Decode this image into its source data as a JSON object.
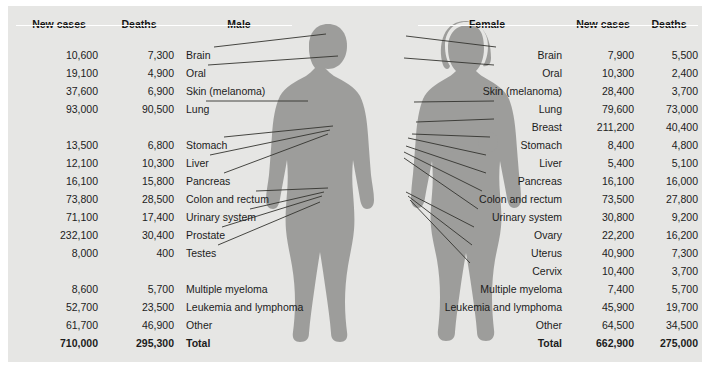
{
  "figure": {
    "panel_bg": "#e6e6e4",
    "silhouette_color": "#9a9a98",
    "leader_line_color": "#33332f"
  },
  "male": {
    "headers": {
      "new_cases": "New cases",
      "deaths": "Deaths",
      "site": "Male"
    },
    "rows": [
      {
        "site": "Brain",
        "new_cases": "10,600",
        "deaths": "7,300",
        "y": 40,
        "leader": true
      },
      {
        "site": "Oral",
        "new_cases": "19,100",
        "deaths": "4,900",
        "y": 58,
        "leader": true
      },
      {
        "site": "Skin (melanoma)",
        "new_cases": "37,600",
        "deaths": "6,900",
        "y": 76,
        "leader": false
      },
      {
        "site": "Lung",
        "new_cases": "93,000",
        "deaths": "90,500",
        "y": 94,
        "leader": true
      },
      {
        "site": "Stomach",
        "new_cases": "13,500",
        "deaths": "6,800",
        "y": 130,
        "leader": true
      },
      {
        "site": "Liver",
        "new_cases": "12,100",
        "deaths": "10,300",
        "y": 148,
        "leader": true
      },
      {
        "site": "Pancreas",
        "new_cases": "16,100",
        "deaths": "15,800",
        "y": 166,
        "leader": true
      },
      {
        "site": "Colon and rectum",
        "new_cases": "73,800",
        "deaths": "28,500",
        "y": 184,
        "leader": true
      },
      {
        "site": "Urinary system",
        "new_cases": "71,100",
        "deaths": "17,400",
        "y": 202,
        "leader": true
      },
      {
        "site": "Prostate",
        "new_cases": "232,100",
        "deaths": "30,400",
        "y": 220,
        "leader": true
      },
      {
        "site": "Testes",
        "new_cases": "8,000",
        "deaths": "400",
        "y": 238,
        "leader": true
      },
      {
        "site": "Multiple myeloma",
        "new_cases": "8,600",
        "deaths": "5,700",
        "y": 274,
        "leader": false
      },
      {
        "site": "Leukemia and lymphoma",
        "new_cases": "52,700",
        "deaths": "23,500",
        "y": 292,
        "leader": false
      },
      {
        "site": "Other",
        "new_cases": "61,700",
        "deaths": "46,900",
        "y": 310,
        "leader": false
      },
      {
        "site": "Total",
        "new_cases": "710,000",
        "deaths": "295,300",
        "y": 328,
        "leader": false,
        "total": true
      }
    ]
  },
  "female": {
    "headers": {
      "site": "Female",
      "new_cases": "New cases",
      "deaths": "Deaths"
    },
    "rows": [
      {
        "site": "Brain",
        "new_cases": "7,900",
        "deaths": "5,500",
        "y": 40,
        "leader": true
      },
      {
        "site": "Oral",
        "new_cases": "10,300",
        "deaths": "2,400",
        "y": 58,
        "leader": true
      },
      {
        "site": "Skin (melanoma)",
        "new_cases": "28,400",
        "deaths": "3,700",
        "y": 76,
        "leader": false
      },
      {
        "site": "Lung",
        "new_cases": "79,600",
        "deaths": "73,000",
        "y": 94,
        "leader": true
      },
      {
        "site": "Breast",
        "new_cases": "211,200",
        "deaths": "40,400",
        "y": 112,
        "leader": true
      },
      {
        "site": "Stomach",
        "new_cases": "8,400",
        "deaths": "4,800",
        "y": 130,
        "leader": true
      },
      {
        "site": "Liver",
        "new_cases": "5,400",
        "deaths": "5,100",
        "y": 148,
        "leader": true
      },
      {
        "site": "Pancreas",
        "new_cases": "16,100",
        "deaths": "16,000",
        "y": 166,
        "leader": true
      },
      {
        "site": "Colon and rectum",
        "new_cases": "73,500",
        "deaths": "27,800",
        "y": 184,
        "leader": true
      },
      {
        "site": "Urinary system",
        "new_cases": "30,800",
        "deaths": "9,200",
        "y": 202,
        "leader": true
      },
      {
        "site": "Ovary",
        "new_cases": "22,200",
        "deaths": "16,200",
        "y": 220,
        "leader": true
      },
      {
        "site": "Uterus",
        "new_cases": "40,900",
        "deaths": "7,300",
        "y": 238,
        "leader": true
      },
      {
        "site": "Cervix",
        "new_cases": "10,400",
        "deaths": "3,700",
        "y": 256,
        "leader": true
      },
      {
        "site": "Multiple myeloma",
        "new_cases": "7,400",
        "deaths": "5,700",
        "y": 274,
        "leader": false
      },
      {
        "site": "Leukemia and lymphoma",
        "new_cases": "45,900",
        "deaths": "19,700",
        "y": 292,
        "leader": false
      },
      {
        "site": "Other",
        "new_cases": "64,500",
        "deaths": "34,500",
        "y": 310,
        "leader": false
      },
      {
        "site": "Total",
        "new_cases": "662,900",
        "deaths": "275,000",
        "y": 328,
        "leader": false,
        "total": true
      }
    ]
  },
  "chart_data": {
    "type": "table",
    "categories": [
      "Brain",
      "Oral",
      "Skin (melanoma)",
      "Lung",
      "Breast",
      "Stomach",
      "Liver",
      "Pancreas",
      "Colon and rectum",
      "Urinary system",
      "Prostate",
      "Testes",
      "Ovary",
      "Uterus",
      "Cervix",
      "Multiple myeloma",
      "Leukemia and lymphoma",
      "Other",
      "Total"
    ],
    "series": [
      {
        "name": "Male new cases",
        "values": [
          10600,
          19100,
          37600,
          93000,
          null,
          13500,
          12100,
          16100,
          73800,
          71100,
          232100,
          8000,
          null,
          null,
          null,
          8600,
          52700,
          61700,
          710000
        ]
      },
      {
        "name": "Male deaths",
        "values": [
          7300,
          4900,
          6900,
          90500,
          null,
          6800,
          10300,
          15800,
          28500,
          17400,
          30400,
          400,
          null,
          null,
          null,
          5700,
          23500,
          46900,
          295300
        ]
      },
      {
        "name": "Female new cases",
        "values": [
          7900,
          10300,
          28400,
          79600,
          211200,
          8400,
          5400,
          16100,
          73500,
          30800,
          null,
          null,
          22200,
          40900,
          10400,
          7400,
          45900,
          64500,
          662900
        ]
      },
      {
        "name": "Female deaths",
        "values": [
          5500,
          2400,
          3700,
          73000,
          40400,
          4800,
          5100,
          16000,
          27800,
          9200,
          null,
          null,
          16200,
          7300,
          3700,
          5700,
          19700,
          34500,
          275000
        ]
      }
    ],
    "xlabel": "Cancer site",
    "ylabel": "Number of people"
  }
}
